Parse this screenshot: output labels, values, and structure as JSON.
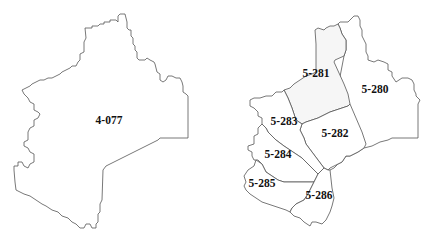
{
  "maps": [
    {
      "name": "before",
      "regions": [
        {
          "id": "4-077",
          "label": "4-077",
          "fill": "#ffffff"
        }
      ]
    },
    {
      "name": "after",
      "regions": [
        {
          "id": "5-280",
          "label": "5-280",
          "fill": "#ffffff"
        },
        {
          "id": "5-281",
          "label": "5-281",
          "fill": "#f6f6f6"
        },
        {
          "id": "5-282",
          "label": "5-282",
          "fill": "#ffffff"
        },
        {
          "id": "5-283",
          "label": "5-283",
          "fill": "#ffffff"
        },
        {
          "id": "5-284",
          "label": "5-284",
          "fill": "#ffffff"
        },
        {
          "id": "5-285",
          "label": "5-285",
          "fill": "#ffffff"
        },
        {
          "id": "5-286",
          "label": "5-286",
          "fill": "#ffffff"
        }
      ]
    }
  ],
  "colors": {
    "border": "#555555",
    "background": "#ffffff",
    "label": "#111111"
  }
}
